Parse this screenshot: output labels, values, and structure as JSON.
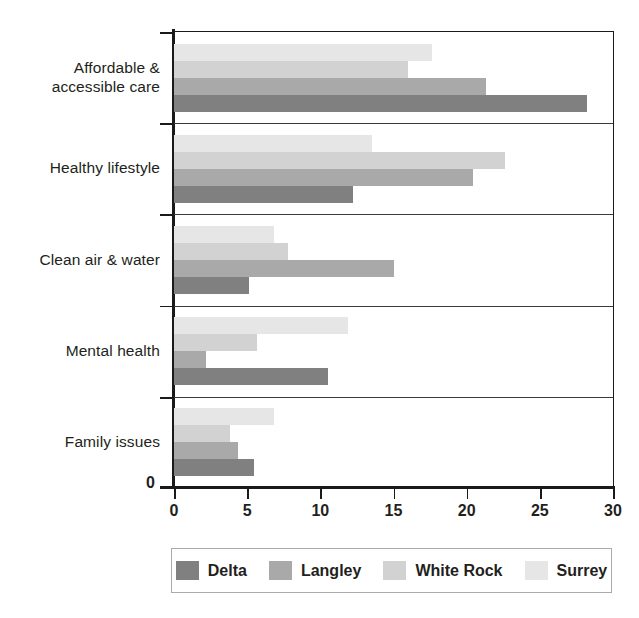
{
  "chart_data": {
    "type": "bar",
    "orientation": "horizontal",
    "title": "",
    "xlabel": "",
    "ylabel": "",
    "xlim": [
      0,
      30
    ],
    "xticks": [
      0,
      5,
      10,
      15,
      20,
      25,
      30
    ],
    "xtick_labels": [
      "0",
      "5",
      "10",
      "15",
      "20",
      "25",
      "30"
    ],
    "grid": false,
    "legend_position": "bottom",
    "categories": [
      "Affordable & accessible care",
      "Healthy lifestyle",
      "Clean air & water",
      "Mental health",
      "Family issues"
    ],
    "series": [
      {
        "name": "Surrey",
        "color": "#e6e6e6",
        "values": [
          17.6,
          13.5,
          6.8,
          11.9,
          6.8
        ]
      },
      {
        "name": "White Rock",
        "color": "#d2d2d2",
        "values": [
          16.0,
          22.6,
          7.8,
          5.7,
          3.8
        ]
      },
      {
        "name": "Langley",
        "color": "#a9a9a9",
        "values": [
          21.3,
          20.4,
          15.0,
          2.2,
          4.4
        ]
      },
      {
        "name": "Delta",
        "color": "#808080",
        "values": [
          28.2,
          12.2,
          5.1,
          10.5,
          5.5
        ]
      }
    ]
  },
  "legend": {
    "entries": [
      {
        "label": "Delta",
        "color": "#808080"
      },
      {
        "label": "Langley",
        "color": "#a9a9a9"
      },
      {
        "label": "White Rock",
        "color": "#d2d2d2"
      },
      {
        "label": "Surrey",
        "color": "#e6e6e6"
      }
    ]
  },
  "axis": {
    "zero_origin_label": "0"
  }
}
